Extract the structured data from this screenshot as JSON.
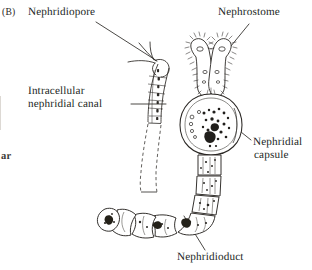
{
  "figure": {
    "panel_letter": "(B)",
    "background_color": "#ffffff",
    "ink_color": "#201e1c",
    "width": 312,
    "height": 270
  },
  "labels": {
    "nephridiopore": "Nephridiopore",
    "intracellular_line1": "Intracellular",
    "intracellular_line2": "nephridial canal",
    "nephrostome": "Nephrostome",
    "nephridial_capsule_line1": "Nephridial",
    "nephridial_capsule_line2": "capsule",
    "nephridioduct": "Nephridioduct",
    "edge_fragment": "ar"
  },
  "structures": [
    {
      "name": "nephridiopore",
      "description": "external opening at the upper end of the nephridial canal"
    },
    {
      "name": "intracellular-nephridial-canal",
      "description": "dashed-outline tubular canal descending from the nephridiopore"
    },
    {
      "name": "nephrostome",
      "description": "paired ciliated funnel lobes at the top of the capsule"
    },
    {
      "name": "nephridial-capsule",
      "description": "rounded granular body below the nephrostome funnels"
    },
    {
      "name": "nephridioduct",
      "description": "beaded coiled duct curving from the capsule down and to the left"
    }
  ],
  "leader_lines": [
    {
      "name": "leader-nephridiopore",
      "from_label": "nephridiopore",
      "to_structure": "nephridiopore"
    },
    {
      "name": "leader-intracellular-canal",
      "from_label": "intracellular_nephridial_canal",
      "to_structure": "intracellular-nephridial-canal"
    },
    {
      "name": "leader-nephrostome",
      "from_label": "nephrostome",
      "to_structure": "nephrostome"
    },
    {
      "name": "leader-nephridial-capsule",
      "from_label": "nephridial_capsule",
      "to_structure": "nephridial-capsule"
    },
    {
      "name": "leader-nephridioduct",
      "from_label": "nephridioduct",
      "to_structure": "nephridioduct"
    }
  ]
}
